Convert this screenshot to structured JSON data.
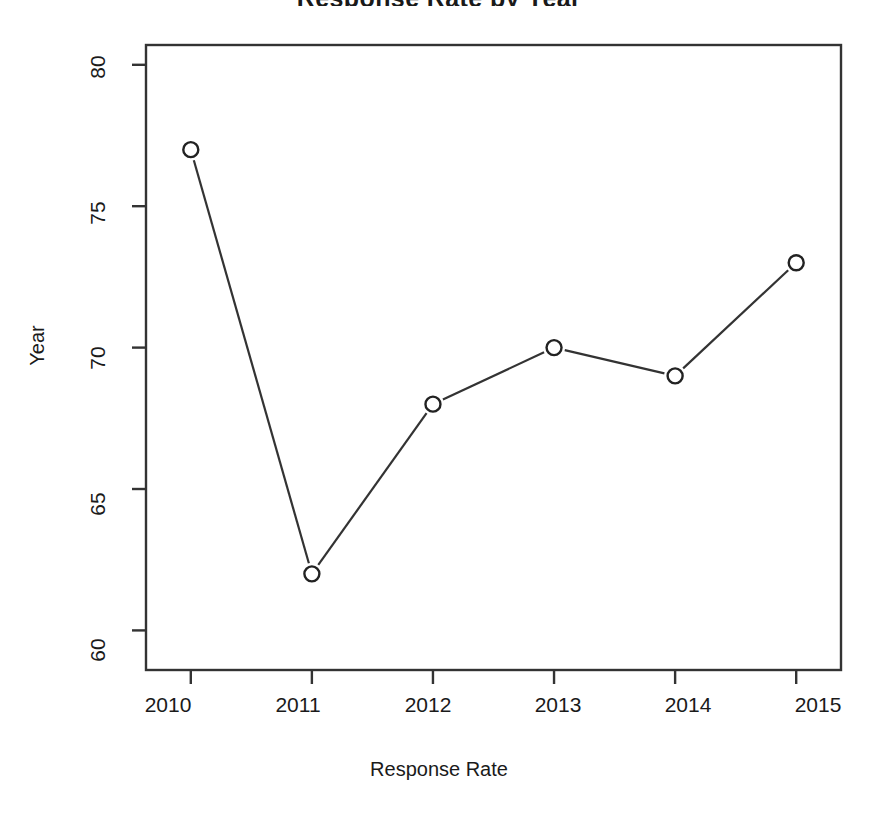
{
  "chart_data": {
    "type": "line",
    "title": "Response Rate by Year",
    "title_visible_fragment": "",
    "xlabel": "Response Rate",
    "ylabel": "Year",
    "categories": [
      "2010",
      "2011",
      "2012",
      "2013",
      "2014",
      "2015"
    ],
    "x": [
      2010,
      2011,
      2012,
      2013,
      2014,
      2015
    ],
    "values": [
      77,
      62,
      68,
      70,
      69,
      73
    ],
    "series": [
      {
        "name": "Response Rate",
        "values": [
          77,
          62,
          68,
          70,
          69,
          73
        ]
      }
    ],
    "xticks": [
      "2010",
      "2011",
      "2012",
      "2013",
      "2014",
      "2015"
    ],
    "yticks": [
      "60",
      "65",
      "70",
      "75",
      "80"
    ],
    "ytick_values": [
      60,
      65,
      70,
      75,
      80
    ],
    "ylim": [
      58.6,
      80.7
    ],
    "xlim": [
      2009.63,
      2015.37
    ],
    "grid": false,
    "legend": false,
    "marker": "open-circle",
    "line_color": "#333333",
    "marker_color": "#222222",
    "axis_color": "#333333",
    "background": "#ffffff"
  },
  "plot_box": {
    "left": 146,
    "right": 841,
    "top": 45,
    "bottom": 670
  }
}
